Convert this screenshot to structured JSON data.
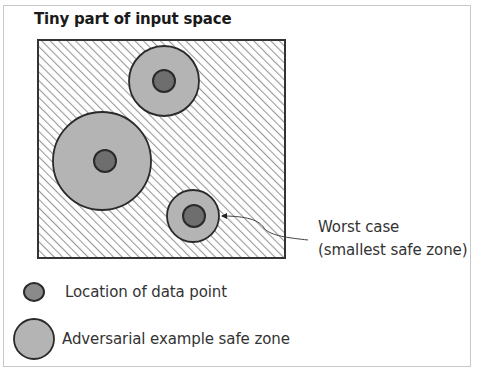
{
  "title": "Tiny part of input space",
  "annotation": {
    "line1": "Worst case",
    "line2": "(smallest safe zone)"
  },
  "legend": [
    {
      "icon": "data-point-icon",
      "label": "Location of data point"
    },
    {
      "icon": "safe-zone-icon",
      "label": "Adversarial example safe zone"
    }
  ],
  "colors": {
    "safe_zone_fill": "#b4b4b4",
    "data_point_fill": "#6e6e6e",
    "outline": "#2a2a2a",
    "hatch": "#9a9a9a"
  },
  "circles": [
    {
      "name": "top-circle",
      "cx": 164,
      "cy": 81,
      "r": 35,
      "dot_r": 11
    },
    {
      "name": "left-circle",
      "cx": 102,
      "cy": 161,
      "r": 49,
      "dot_r": 11
    },
    {
      "name": "worst-case-circle",
      "cx": 193,
      "cy": 216,
      "r": 26,
      "dot_r": 11
    }
  ]
}
